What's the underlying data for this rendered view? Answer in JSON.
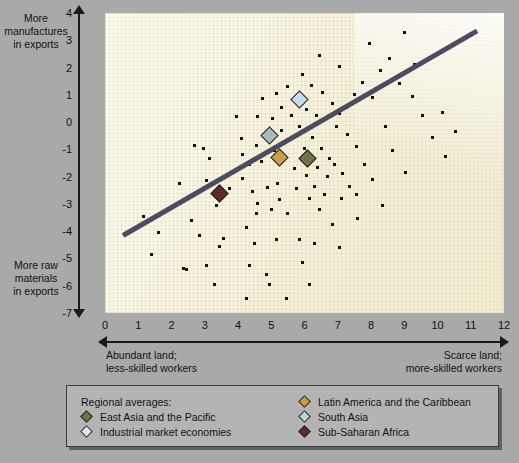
{
  "chart_data": {
    "type": "scatter",
    "title": "",
    "xlabel": "",
    "ylabel": "",
    "xlim": [
      0,
      12
    ],
    "ylim": [
      -7,
      4
    ],
    "grid": true,
    "x_ticks": [
      "0",
      "1",
      "2",
      "3",
      "4",
      "5",
      "6",
      "7",
      "8",
      "9",
      "10",
      "11",
      "12"
    ],
    "y_ticks": [
      "4",
      "3",
      "2",
      "1",
      "0",
      "-1",
      "-2",
      "-3",
      "-4",
      "-5",
      "-6",
      "-7"
    ],
    "axis_captions": {
      "y_top": "More\nmanufactures\nin exports",
      "y_top_lines": [
        "More",
        "manufactures",
        "in exports"
      ],
      "y_bottom_lines": [
        "More raw",
        "materials",
        "in exports"
      ],
      "x_left_lines": [
        "Abundant land;",
        "less-skilled workers"
      ],
      "x_right_lines": [
        "Scarce land;",
        "more-skilled workers"
      ]
    },
    "trendline": {
      "x0": 0.55,
      "y0": -4.15,
      "x1": 11.2,
      "y1": 3.35,
      "color": "#4e4a60",
      "width_px": 5
    },
    "points": [
      [
        2.7,
        -0.85
      ],
      [
        4.15,
        -2.05
      ],
      [
        3.05,
        -2.15
      ],
      [
        3.35,
        -3.05
      ],
      [
        3.55,
        -4.25
      ],
      [
        3.45,
        -4.55
      ],
      [
        2.35,
        -5.35
      ],
      [
        2.45,
        -5.4
      ],
      [
        3.05,
        -5.25
      ],
      [
        3.3,
        -5.95
      ],
      [
        4.25,
        -6.45
      ],
      [
        4.55,
        -3.35
      ],
      [
        4.5,
        -4.45
      ],
      [
        4.35,
        -5.25
      ],
      [
        4.85,
        -5.6
      ],
      [
        5.15,
        -4.3
      ],
      [
        5.25,
        -2.85
      ],
      [
        5.0,
        -3.2
      ],
      [
        5.5,
        -3.35
      ],
      [
        5.85,
        -4.3
      ],
      [
        5.95,
        -5.15
      ],
      [
        6.15,
        -5.95
      ],
      [
        4.7,
        -1.45
      ],
      [
        4.35,
        -1.55
      ],
      [
        4.15,
        -1.2
      ],
      [
        4.55,
        -0.85
      ],
      [
        4.1,
        -0.6
      ],
      [
        4.8,
        -0.55
      ],
      [
        5.3,
        -0.3
      ],
      [
        5.55,
        -0.65
      ],
      [
        5.1,
        -1.05
      ],
      [
        5.4,
        -1.35
      ],
      [
        5.7,
        -1.7
      ],
      [
        5.2,
        -2.25
      ],
      [
        4.9,
        -2.4
      ],
      [
        4.45,
        -2.55
      ],
      [
        4.6,
        -3.0
      ],
      [
        5.75,
        -2.45
      ],
      [
        6.05,
        -1.95
      ],
      [
        6.3,
        -2.35
      ],
      [
        6.15,
        -2.8
      ],
      [
        6.45,
        -3.2
      ],
      [
        6.6,
        -2.65
      ],
      [
        6.85,
        -3.75
      ],
      [
        6.3,
        -4.45
      ],
      [
        7.05,
        -4.6
      ],
      [
        6.0,
        -0.95
      ],
      [
        6.25,
        -0.55
      ],
      [
        6.5,
        -0.95
      ],
      [
        6.75,
        -1.35
      ],
      [
        6.4,
        -1.65
      ],
      [
        6.7,
        -2.0
      ],
      [
        6.9,
        -1.55
      ],
      [
        7.15,
        -1.9
      ],
      [
        7.35,
        -2.35
      ],
      [
        7.1,
        -2.8
      ],
      [
        5.6,
        0.25
      ],
      [
        5.3,
        0.55
      ],
      [
        5.75,
        0.85
      ],
      [
        6.05,
        0.45
      ],
      [
        6.35,
        0.25
      ],
      [
        5.05,
        0.15
      ],
      [
        4.6,
        0.2
      ],
      [
        6.55,
        1.1
      ],
      [
        6.85,
        0.7
      ],
      [
        7.05,
        0.3
      ],
      [
        7.3,
        -0.45
      ],
      [
        7.55,
        -0.9
      ],
      [
        7.8,
        -1.55
      ],
      [
        8.05,
        -2.1
      ],
      [
        7.55,
        -2.65
      ],
      [
        8.35,
        -3.05
      ],
      [
        7.25,
        0.55
      ],
      [
        7.5,
        1.0
      ],
      [
        7.75,
        1.45
      ],
      [
        8.05,
        0.9
      ],
      [
        8.3,
        1.9
      ],
      [
        8.55,
        2.35
      ],
      [
        9.0,
        3.3
      ],
      [
        8.85,
        1.4
      ],
      [
        9.25,
        0.95
      ],
      [
        9.55,
        0.25
      ],
      [
        9.85,
        -0.55
      ],
      [
        10.25,
        -1.25
      ],
      [
        10.55,
        -0.35
      ],
      [
        9.3,
        2.1
      ],
      [
        7.95,
        2.9
      ],
      [
        7.05,
        2.05
      ],
      [
        6.45,
        2.45
      ],
      [
        5.95,
        1.75
      ],
      [
        6.2,
        1.35
      ],
      [
        5.5,
        1.3
      ],
      [
        5.15,
        1.05
      ],
      [
        4.75,
        0.85
      ],
      [
        3.95,
        0.2
      ],
      [
        2.95,
        -0.95
      ],
      [
        2.25,
        -2.25
      ],
      [
        2.05,
        -3.05
      ],
      [
        1.6,
        -4.05
      ],
      [
        1.4,
        -4.85
      ],
      [
        1.15,
        -3.45
      ],
      [
        2.6,
        -3.6
      ],
      [
        2.85,
        -4.15
      ],
      [
        3.75,
        -2.45
      ],
      [
        3.85,
        -1.85
      ],
      [
        4.95,
        -5.95
      ],
      [
        5.45,
        -6.45
      ],
      [
        7.6,
        -3.55
      ],
      [
        8.65,
        -1.05
      ],
      [
        9.05,
        -1.85
      ],
      [
        10.15,
        0.35
      ],
      [
        4.25,
        -3.85
      ],
      [
        3.15,
        -1.35
      ],
      [
        5.85,
        -0.15
      ],
      [
        6.95,
        -0.15
      ],
      [
        8.45,
        -0.15
      ]
    ],
    "regional_averages": [
      {
        "name": "East Asia and the Pacific",
        "x": 6.1,
        "y": -1.35,
        "color": "#6f7348"
      },
      {
        "name": "Industrial market economies",
        "x": 5.85,
        "y": 0.82,
        "color": "#c9dbe8"
      },
      {
        "name": "Latin America and the Caribbean",
        "x": 5.25,
        "y": -1.3,
        "color": "#c79f4c"
      },
      {
        "name": "South Asia",
        "x": 4.95,
        "y": -0.5,
        "color": "#a9bcbd"
      },
      {
        "name": "Sub-Saharan Africa",
        "x": 3.45,
        "y": -2.62,
        "color": "#5d2c2a"
      }
    ]
  },
  "legend": {
    "title": "Regional averages:",
    "left_items": [
      {
        "label": "East Asia and the Pacific",
        "color": "#6f7348"
      },
      {
        "label": "Industrial market economies",
        "color": "#dce8f2"
      }
    ],
    "right_items": [
      {
        "label": "Latin America and the Caribbean",
        "color": "#c79f4c"
      },
      {
        "label": "South Asia",
        "color": "#c2d2d3"
      },
      {
        "label": "Sub-Saharan Africa",
        "color": "#5d2c2a"
      }
    ]
  },
  "colors": {
    "page_background": "#a9a9a9",
    "plot_background": "#f7f3e0",
    "trendline": "#4e4a60",
    "point": "#14110d",
    "axis": "#1a1a1a",
    "legend_background": "#b4b4b4"
  }
}
